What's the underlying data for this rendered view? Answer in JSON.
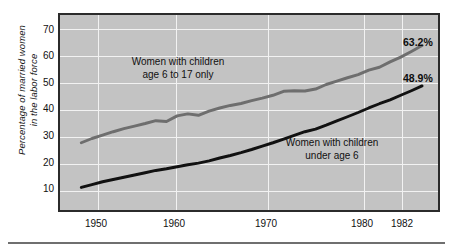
{
  "chart_data": {
    "type": "line",
    "title": "",
    "subtitle": "",
    "xlabel": "",
    "ylabel": "Percentage of married women\nin the labor force",
    "xlim": [
      1948,
      1983.5
    ],
    "ylim": [
      5,
      74
    ],
    "grid": true,
    "legend_position": "inline-annotations",
    "plot_background_color": "#c3c3c3",
    "gridline_color": "#f2f2f2",
    "frame_color": "#2b2b2b",
    "xticks": [
      "1950",
      "1960",
      "1970",
      "1980",
      "1982"
    ],
    "xtick_values": [
      1950,
      1960,
      1970,
      1980,
      1982
    ],
    "yticks": [
      "10",
      "20",
      "30",
      "40",
      "50",
      "60",
      "70"
    ],
    "ytick_values": [
      10,
      20,
      30,
      40,
      50,
      60,
      70
    ],
    "series": [
      {
        "name": "Women with children age 6 to 17 only",
        "annotation": "Women with children\nage 6 to 17 only",
        "color": "#6e6e6e",
        "end_label": "63.2%",
        "x": [
          1950,
          1951,
          1952,
          1953,
          1954,
          1955,
          1956,
          1957,
          1958,
          1959,
          1960,
          1961,
          1962,
          1963,
          1964,
          1965,
          1966,
          1967,
          1968,
          1969,
          1970,
          1971,
          1972,
          1973,
          1974,
          1975,
          1976,
          1977,
          1978,
          1979,
          1980,
          1981,
          1982
        ],
        "values": [
          28.8,
          30.3,
          31.5,
          32.7,
          33.8,
          34.7,
          35.6,
          36.6,
          36.3,
          38.3,
          39.0,
          38.5,
          40.0,
          41.1,
          42.0,
          42.7,
          43.7,
          44.6,
          45.6,
          47.0,
          47.2,
          47.1,
          47.8,
          49.4,
          50.6,
          51.8,
          52.9,
          54.5,
          55.5,
          57.4,
          59.1,
          61.1,
          63.2
        ]
      },
      {
        "name": "Women with children under age 6",
        "annotation": "Women with children\nunder age 6",
        "color": "#111111",
        "end_label": "48.9%",
        "x": [
          1950,
          1951,
          1952,
          1953,
          1954,
          1955,
          1956,
          1957,
          1958,
          1959,
          1960,
          1961,
          1962,
          1963,
          1964,
          1965,
          1966,
          1967,
          1968,
          1969,
          1970,
          1971,
          1972,
          1973,
          1974,
          1975,
          1976,
          1977,
          1978,
          1979,
          1980,
          1981,
          1982
        ],
        "values": [
          13.0,
          14.0,
          15.0,
          15.8,
          16.6,
          17.4,
          18.2,
          19.0,
          19.6,
          20.3,
          21.0,
          21.6,
          22.4,
          23.4,
          24.3,
          25.3,
          26.4,
          27.6,
          28.8,
          30.1,
          31.4,
          32.7,
          33.6,
          35.0,
          36.5,
          38.0,
          39.5,
          41.1,
          42.6,
          44.0,
          45.6,
          47.2,
          48.9
        ]
      }
    ],
    "annotations": [
      {
        "name": "note-older-children",
        "text": "Women with children\nage 6 to 17 only",
        "x": 1959.0,
        "y": 53.0
      },
      {
        "name": "note-young-children",
        "text": "Women with children\nunder age 6",
        "x": 1975.0,
        "y": 30.5
      }
    ]
  }
}
